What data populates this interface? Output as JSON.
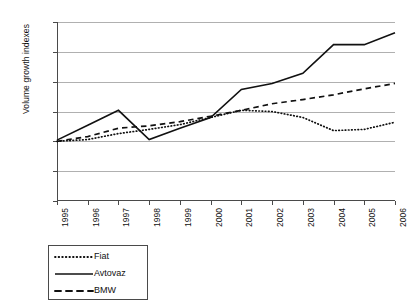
{
  "chart_data": {
    "type": "line",
    "title": "",
    "xlabel": "",
    "ylabel": "Volume growth indexes",
    "categories": [
      "1995",
      "1996",
      "1997",
      "1998",
      "1999",
      "2000",
      "2001",
      "2002",
      "2003",
      "2004",
      "2005",
      "2006"
    ],
    "ylim": [
      0,
      300
    ],
    "ytick_values": [
      0,
      50,
      100,
      150,
      200,
      250,
      300
    ],
    "ytick_labels": [
      "0",
      "50",
      "100",
      "150",
      "200",
      "250",
      "300"
    ],
    "grid": true,
    "legend_position": "below-left",
    "series": [
      {
        "name": "Fiat",
        "style": "dotted",
        "color": "#111111",
        "values": [
          100,
          103,
          113,
          120,
          128,
          140,
          152,
          150,
          140,
          118,
          120,
          132
        ]
      },
      {
        "name": "Avtovaz",
        "style": "solid",
        "color": "#111111",
        "values": [
          102,
          127,
          152,
          103,
          122,
          140,
          187,
          197,
          214,
          262,
          262,
          282
        ]
      },
      {
        "name": "BMW",
        "style": "dashed",
        "color": "#111111",
        "values": [
          100,
          108,
          122,
          126,
          133,
          142,
          152,
          163,
          170,
          178,
          188,
          197
        ]
      }
    ]
  },
  "legend": {
    "entries": [
      {
        "label": "Fiat",
        "icon": "dotted-line-icon"
      },
      {
        "label": "Avtovaz",
        "icon": "solid-line-icon"
      },
      {
        "label": "BMW",
        "icon": "dashed-line-icon"
      }
    ]
  }
}
